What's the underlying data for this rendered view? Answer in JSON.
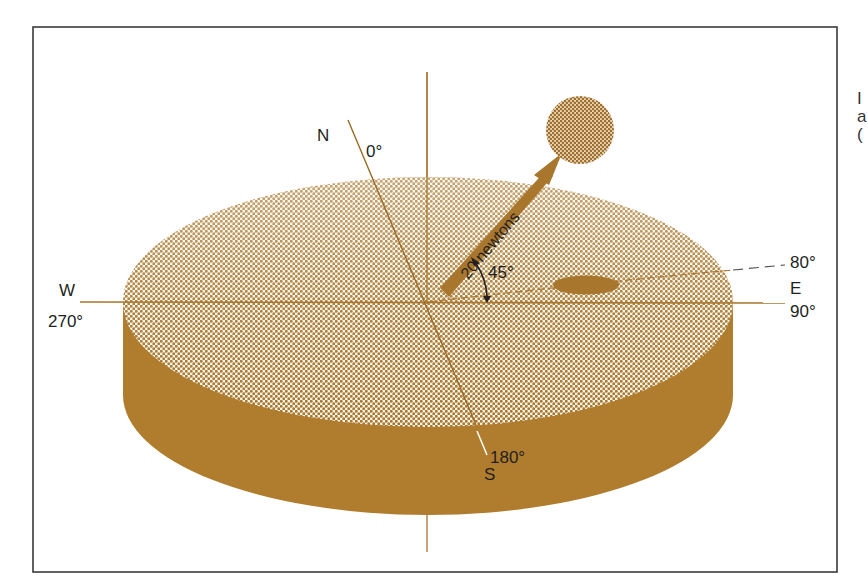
{
  "figure": {
    "colors": {
      "frame": "#3a3a3a",
      "brown": "#b07d2e",
      "brown_dark": "#9e6c22",
      "dot_fill": "#a8762c",
      "text": "#231f20",
      "background": "#ffffff"
    },
    "compass": {
      "north": {
        "letter": "N",
        "degrees": "0°"
      },
      "east": {
        "letter": "E",
        "degrees": "90°"
      },
      "south": {
        "letter": "S",
        "degrees": "180°"
      },
      "west": {
        "letter": "W",
        "degrees": "270°"
      }
    },
    "force_vector": {
      "label": "20 newtons",
      "angle_label": "45°"
    },
    "dashed_line": {
      "label": "80°"
    },
    "edge_text_fragment": [
      "I",
      "a",
      "("
    ]
  }
}
